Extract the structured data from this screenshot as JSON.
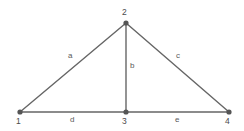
{
  "diagram": {
    "type": "undirected-graph-triangle",
    "background_color": "#ffffff",
    "edge_color": "#666666",
    "vertex_color": "#555555",
    "label_color": "#555555",
    "nodes": [
      {
        "id": "1",
        "label": "1",
        "x": 20,
        "y": 112,
        "label_x": 16,
        "label_y": 117
      },
      {
        "id": "2",
        "label": "2",
        "x": 126,
        "y": 23,
        "label_x": 122,
        "label_y": 8
      },
      {
        "id": "3",
        "label": "3",
        "x": 126,
        "y": 112,
        "label_x": 122,
        "label_y": 117
      },
      {
        "id": "4",
        "label": "4",
        "x": 229,
        "y": 112,
        "label_x": 225,
        "label_y": 117
      }
    ],
    "edges": [
      {
        "id": "a",
        "label": "a",
        "from": "1",
        "to": "2",
        "x1": 20,
        "y1": 112,
        "x2": 126,
        "y2": 23,
        "label_x": 68,
        "label_y": 52
      },
      {
        "id": "b",
        "label": "b",
        "from": "2",
        "to": "3",
        "x1": 126,
        "y1": 23,
        "x2": 126,
        "y2": 112,
        "label_x": 130,
        "label_y": 62
      },
      {
        "id": "c",
        "label": "c",
        "from": "2",
        "to": "4",
        "x1": 126,
        "y1": 23,
        "x2": 229,
        "y2": 112,
        "label_x": 176,
        "label_y": 52
      },
      {
        "id": "d",
        "label": "d",
        "from": "1",
        "to": "3",
        "x1": 20,
        "y1": 112,
        "x2": 126,
        "y2": 112,
        "label_x": 70,
        "label_y": 116
      },
      {
        "id": "e",
        "label": "e",
        "from": "3",
        "to": "4",
        "x1": 126,
        "y1": 112,
        "x2": 229,
        "y2": 112,
        "label_x": 175,
        "label_y": 116
      }
    ]
  }
}
